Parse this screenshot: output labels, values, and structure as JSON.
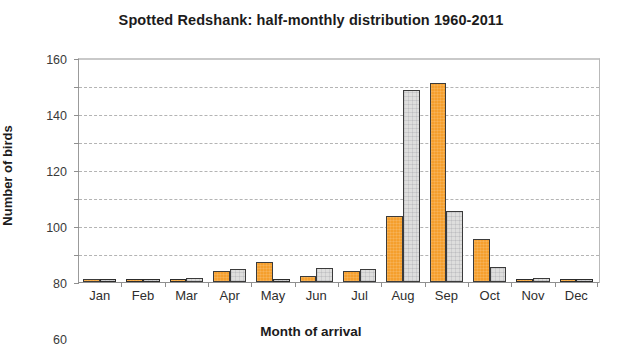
{
  "chart_data": {
    "type": "bar",
    "title": "Spotted Redshank: half-monthly distribution 1960-2011",
    "xlabel": "Month of arrival",
    "ylabel": "Number of birds",
    "ylim": [
      0,
      160
    ],
    "ytick_labels": [
      "0",
      "20",
      "40",
      "60",
      "80",
      "100",
      "120",
      "140",
      "160"
    ],
    "ytick_values": [
      0,
      20,
      40,
      60,
      80,
      100,
      120,
      140,
      160
    ],
    "grid": "horizontal-dashed",
    "legend": "none",
    "categories": [
      "Jan",
      "Feb",
      "Mar",
      "Apr",
      "May",
      "Jun",
      "Jul",
      "Aug",
      "Sep",
      "Oct",
      "Nov",
      "Dec"
    ],
    "series": [
      {
        "name": "First half of month",
        "color": "#f59f2d",
        "values": [
          2,
          0,
          0,
          8,
          14,
          4,
          8,
          47,
          142,
          31,
          1,
          0
        ]
      },
      {
        "name": "Second half of month",
        "color": "#dededd",
        "values": [
          0,
          0,
          3,
          9,
          1,
          10,
          9,
          137,
          51,
          11,
          3,
          0
        ]
      }
    ]
  },
  "axes": {
    "y_title": "Number of birds",
    "x_title": "Month of arrival"
  }
}
